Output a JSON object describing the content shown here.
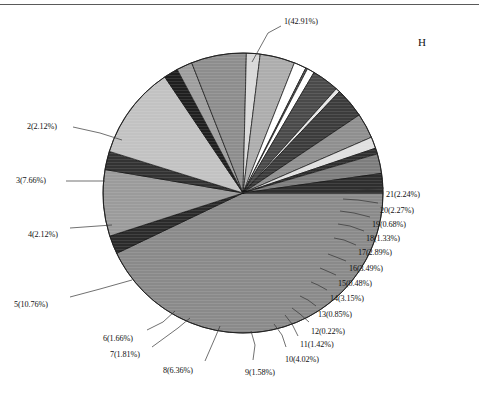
{
  "figure": {
    "panel_letter": "H",
    "background_color": "#ffffff",
    "border_color": "#5a5a5a"
  },
  "chart_data": {
    "type": "pie",
    "title": "",
    "xlabel": "",
    "ylabel": "",
    "legend_position": "none",
    "grid": false,
    "start_angle_deg": 0,
    "direction": "clockwise",
    "center": {
      "x": 243,
      "y": 193
    },
    "radius": 140,
    "categories": [
      "1",
      "2",
      "3",
      "4",
      "5",
      "6",
      "7",
      "8",
      "9",
      "10",
      "11",
      "12",
      "13",
      "14",
      "15",
      "16",
      "17",
      "18",
      "19",
      "20",
      "21"
    ],
    "values": [
      42.91,
      2.12,
      7.66,
      2.12,
      10.76,
      1.66,
      1.81,
      6.36,
      1.58,
      4.02,
      1.42,
      0.22,
      0.85,
      3.15,
      0.48,
      3.49,
      2.89,
      1.33,
      0.68,
      2.27,
      2.24
    ],
    "unit": "%",
    "slices": [
      {
        "id": "1",
        "label": "1(42.91%)",
        "value": 42.91,
        "color": "#8a8a8a",
        "label_x": 284,
        "label_y": 17,
        "leader": [
          [
            281,
            26
          ],
          [
            268,
            33
          ],
          [
            252,
            62
          ]
        ]
      },
      {
        "id": "2",
        "label": "2(2.12%)",
        "value": 2.12,
        "color": "#2b2b2b",
        "label_x": 27,
        "label_y": 122,
        "leader": [
          [
            73,
            127
          ],
          [
            100,
            133
          ],
          [
            122,
            140
          ]
        ]
      },
      {
        "id": "3",
        "label": "3(7.66%)",
        "value": 7.66,
        "color": "#9b9b9b",
        "label_x": 16,
        "label_y": 176,
        "leader": [
          [
            66,
            181
          ],
          [
            105,
            181
          ]
        ]
      },
      {
        "id": "4",
        "label": "4(2.12%)",
        "value": 2.12,
        "color": "#333333",
        "label_x": 28,
        "label_y": 230,
        "leader": [
          [
            70,
            228
          ],
          [
            112,
            225
          ]
        ]
      },
      {
        "id": "5",
        "label": "5(10.76%)",
        "value": 10.76,
        "color": "#c2c2c2",
        "label_x": 14,
        "label_y": 300,
        "leader": [
          [
            70,
            297
          ],
          [
            100,
            289
          ],
          [
            132,
            280
          ]
        ]
      },
      {
        "id": "6",
        "label": "6(1.66%)",
        "value": 1.66,
        "color": "#1f1f1f",
        "label_x": 103,
        "label_y": 334,
        "leader": [
          [
            147,
            330
          ],
          [
            163,
            322
          ],
          [
            175,
            311
          ]
        ]
      },
      {
        "id": "7",
        "label": "7(1.81%)",
        "value": 1.81,
        "color": "#9e9e9e",
        "label_x": 110,
        "label_y": 350,
        "leader": [
          [
            152,
            347
          ],
          [
            178,
            328
          ],
          [
            190,
            318
          ]
        ]
      },
      {
        "id": "8",
        "label": "8(6.36%)",
        "value": 6.36,
        "color": "#8d8d8d",
        "label_x": 163,
        "label_y": 366,
        "leader": [
          [
            205,
            361
          ],
          [
            215,
            338
          ],
          [
            220,
            326
          ]
        ]
      },
      {
        "id": "9",
        "label": "9(1.58%)",
        "value": 1.58,
        "color": "#d8d8d8",
        "label_x": 245,
        "label_y": 368,
        "leader": [
          [
            253,
            360
          ],
          [
            255,
            345
          ],
          [
            251,
            331
          ]
        ]
      },
      {
        "id": "10",
        "label": "10(4.02%)",
        "value": 4.02,
        "color": "#adadad",
        "label_x": 285,
        "label_y": 355,
        "leader": [
          [
            286,
            347
          ],
          [
            282,
            335
          ],
          [
            274,
            324
          ]
        ]
      },
      {
        "id": "11",
        "label": "11(1.42%)",
        "value": 1.42,
        "color": "#ffffff",
        "label_x": 300,
        "label_y": 340,
        "leader": [
          [
            298,
            336
          ],
          [
            292,
            324
          ],
          [
            285,
            315
          ]
        ]
      },
      {
        "id": "12",
        "label": "12(0.22%)",
        "value": 0.22,
        "color": "#545454",
        "label_x": 311,
        "label_y": 327,
        "leader": [
          [
            309,
            322
          ],
          [
            300,
            314
          ],
          [
            292,
            308
          ]
        ]
      },
      {
        "id": "13",
        "label": "13(0.85%)",
        "value": 0.85,
        "color": "#ffffff",
        "label_x": 318,
        "label_y": 310,
        "leader": [
          [
            316,
            306
          ],
          [
            308,
            300
          ],
          [
            300,
            296
          ]
        ]
      },
      {
        "id": "14",
        "label": "14(3.15%)",
        "value": 3.15,
        "color": "#4a4a4a",
        "label_x": 330,
        "label_y": 294,
        "leader": [
          [
            327,
            290
          ],
          [
            318,
            285
          ],
          [
            311,
            282
          ]
        ]
      },
      {
        "id": "15",
        "label": "15(0.48%)",
        "value": 0.48,
        "color": "#e6e6e6",
        "label_x": 338,
        "label_y": 279,
        "leader": [
          [
            336,
            275
          ],
          [
            327,
            271
          ],
          [
            320,
            268
          ]
        ]
      },
      {
        "id": "16",
        "label": "16(3.49%)",
        "value": 3.49,
        "color": "#3c3c3c",
        "label_x": 349,
        "label_y": 264,
        "leader": [
          [
            346,
            261
          ],
          [
            336,
            257
          ],
          [
            328,
            254
          ]
        ]
      },
      {
        "id": "17",
        "label": "17(2.89%)",
        "value": 2.89,
        "color": "#8f8f8f",
        "label_x": 358,
        "label_y": 248,
        "leader": [
          [
            356,
            245
          ],
          [
            344,
            240
          ],
          [
            334,
            238
          ]
        ]
      },
      {
        "id": "18",
        "label": "18(1.33%)",
        "value": 1.33,
        "color": "#e0e0e0",
        "label_x": 366,
        "label_y": 234,
        "leader": [
          [
            364,
            231
          ],
          [
            350,
            226
          ],
          [
            338,
            224
          ]
        ]
      },
      {
        "id": "19",
        "label": "19(0.68%)",
        "value": 0.68,
        "color": "#303030",
        "label_x": 372,
        "label_y": 220,
        "leader": [
          [
            370,
            217
          ],
          [
            354,
            213
          ],
          [
            340,
            211
          ]
        ]
      },
      {
        "id": "20",
        "label": "20(2.27%)",
        "value": 2.27,
        "color": "#7d7d7d",
        "label_x": 380,
        "label_y": 206,
        "leader": [
          [
            378,
            203
          ],
          [
            358,
            200
          ],
          [
            343,
            199
          ]
        ]
      },
      {
        "id": "21",
        "label": "21(2.24%)",
        "value": 2.24,
        "color": "#2e2e2e",
        "label_x": 386,
        "label_y": 190,
        "leader": [
          [
            384,
            188
          ],
          [
            362,
            190
          ],
          [
            345,
            192
          ]
        ]
      }
    ]
  }
}
